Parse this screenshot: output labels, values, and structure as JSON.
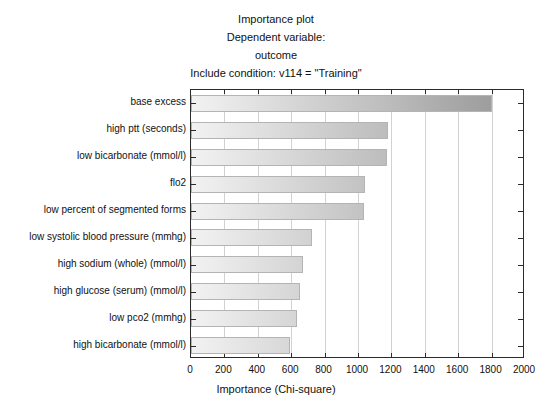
{
  "titles": [
    "Importance plot",
    "Dependent variable:",
    "outcome",
    "Include condition: v114 = \"Training\""
  ],
  "axis": {
    "xlabel": "Importance (Chi-square)",
    "ylabel": "",
    "xticks": [
      "0",
      "200",
      "400",
      "600",
      "800",
      "1000",
      "1200",
      "1400",
      "1600",
      "1800",
      "2000"
    ]
  },
  "style": {
    "bar_light": "#f2f2f2",
    "bar_dark": "#949494",
    "bar_border": "#b4b4b4",
    "frame": "#2b2b2b",
    "gridline": "#d2d2d2",
    "background": "#ffffff"
  },
  "chart_data": {
    "type": "bar",
    "orientation": "horizontal",
    "title": "Importance plot",
    "subtitle": "Dependent variable: outcome",
    "annotation": "Include condition: v114 = \"Training\"",
    "xlabel": "Importance (Chi-square)",
    "ylabel": "",
    "xlim": [
      0,
      2000
    ],
    "xtick_step": 200,
    "grid": true,
    "legend": false,
    "categories": [
      "base excess",
      "high ptt (seconds)",
      "low bicarbonate (mmol/l)",
      "flo2",
      "low percent of segmented forms",
      "low systolic blood pressure (mmhg)",
      "high sodium (whole) (mmol/l)",
      "high glucose (serum) (mmol/l)",
      "low pco2 (mmhg)",
      "high bicarbonate (mmol/l)"
    ],
    "values": [
      1805,
      1180,
      1175,
      1040,
      1035,
      725,
      670,
      655,
      635,
      590
    ]
  }
}
